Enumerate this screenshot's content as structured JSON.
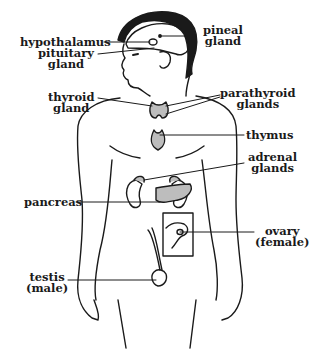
{
  "diagram": {
    "type": "endocrine-system-anatomy",
    "colors": {
      "ink": "#1a1a1a",
      "gland_fill": "#bdbdbd",
      "background": "#ffffff"
    },
    "labels": {
      "hypothalamus": "hypothalamus",
      "pituitary_line1": "pituitary",
      "pituitary_line2": "gland",
      "pineal_line1": "pineal",
      "pineal_line2": "gland",
      "thyroid_line1": "thyroid",
      "thyroid_line2": "gland",
      "parathyroid_line1": "parathyroid",
      "parathyroid_line2": "glands",
      "thymus": "thymus",
      "adrenal_line1": "adrenal",
      "adrenal_line2": "glands",
      "pancreas": "pancreas",
      "ovary_line1": "ovary",
      "ovary_line2": "(female)",
      "testis_line1": "testis",
      "testis_line2": "(male)"
    }
  }
}
